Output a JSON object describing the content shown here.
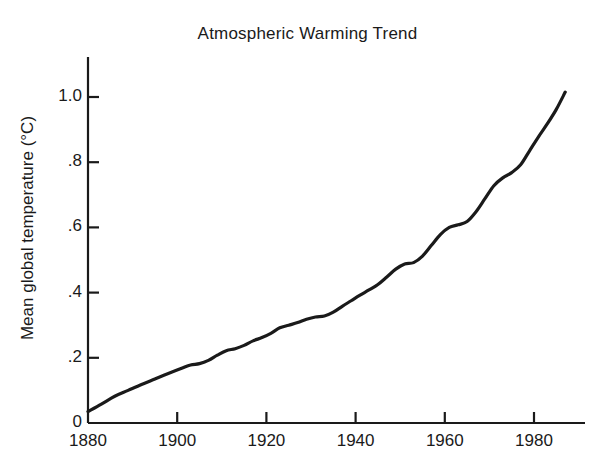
{
  "chart_data": {
    "type": "line",
    "title": "Atmospheric Warming Trend",
    "xlabel": "",
    "ylabel": "Mean global temperature (°C)",
    "xlim": [
      1880,
      1988
    ],
    "ylim": [
      0,
      1.12
    ],
    "grid": false,
    "legend": null,
    "x_ticks": [
      1880,
      1900,
      1920,
      1940,
      1960,
      1980
    ],
    "x_tick_labels": [
      "1880",
      "1900",
      "1920",
      "1940",
      "1960",
      "1980"
    ],
    "y_ticks": [
      0,
      0.2,
      0.4,
      0.6,
      0.8,
      1.0
    ],
    "y_tick_labels": [
      "0",
      ".2",
      ".4",
      ".6",
      ".8",
      "1.0"
    ],
    "line_color": "#1a1a1a",
    "line_width": 3.2,
    "series": [
      {
        "name": "Mean global temperature",
        "x": [
          1880,
          1883,
          1886,
          1889,
          1892,
          1895,
          1898,
          1901,
          1903,
          1905,
          1907,
          1909,
          1911,
          1913,
          1915,
          1917,
          1919,
          1921,
          1923,
          1925,
          1927,
          1929,
          1931,
          1933,
          1935,
          1937,
          1939,
          1941,
          1943,
          1945,
          1947,
          1949,
          1951,
          1953,
          1955,
          1957,
          1959,
          1961,
          1963,
          1965,
          1967,
          1969,
          1971,
          1973,
          1975,
          1977,
          1979,
          1981,
          1983,
          1985,
          1987
        ],
        "y": [
          0.035,
          0.058,
          0.082,
          0.1,
          0.118,
          0.135,
          0.152,
          0.168,
          0.178,
          0.182,
          0.192,
          0.208,
          0.222,
          0.228,
          0.238,
          0.252,
          0.262,
          0.275,
          0.292,
          0.3,
          0.308,
          0.318,
          0.325,
          0.328,
          0.34,
          0.358,
          0.375,
          0.392,
          0.408,
          0.425,
          0.448,
          0.472,
          0.488,
          0.492,
          0.512,
          0.545,
          0.578,
          0.6,
          0.608,
          0.618,
          0.648,
          0.688,
          0.728,
          0.752,
          0.768,
          0.792,
          0.835,
          0.878,
          0.918,
          0.962,
          1.015
        ],
        "y_end_value": 1.08
      }
    ],
    "data_note_start": {
      "year": 1880,
      "value": 0.04
    },
    "data_note_end": {
      "year": 1987,
      "value": 1.08
    }
  }
}
